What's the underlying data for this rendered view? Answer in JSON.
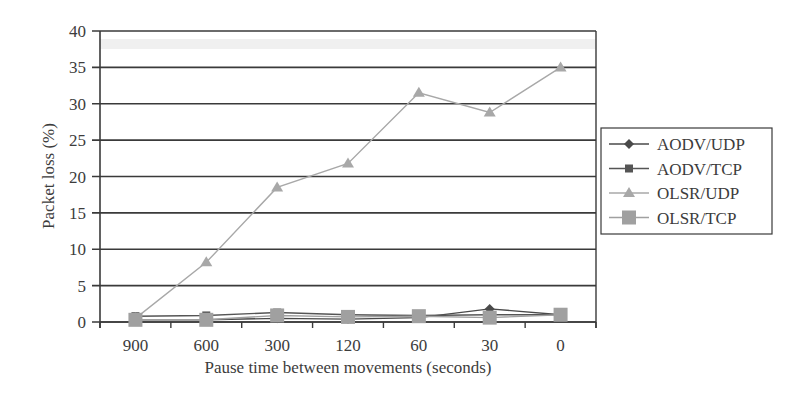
{
  "chart_data": {
    "type": "line",
    "title": "",
    "xlabel": "Pause time between movements (seconds)",
    "ylabel": "Packet loss (%)",
    "categories": [
      "900",
      "600",
      "300",
      "120",
      "60",
      "30",
      "0"
    ],
    "ylim": [
      0,
      40
    ],
    "yticks": [
      0,
      5,
      10,
      15,
      20,
      25,
      30,
      35,
      40
    ],
    "grid": true,
    "legend_position": "right",
    "series": [
      {
        "name": "AODV/UDP",
        "marker": "diamond",
        "color": "#4a4a4a",
        "values": [
          0.3,
          0.3,
          0.5,
          0.4,
          0.6,
          1.8,
          1.0
        ]
      },
      {
        "name": "AODV/TCP",
        "marker": "square-small",
        "color": "#555555",
        "values": [
          0.8,
          0.9,
          1.3,
          1.0,
          0.9,
          1.0,
          1.0
        ]
      },
      {
        "name": "OLSR/UDP",
        "marker": "triangle",
        "color": "#a8a8a8",
        "values": [
          0.5,
          8.2,
          18.5,
          21.8,
          31.5,
          28.8,
          35.0
        ]
      },
      {
        "name": "OLSR/TCP",
        "marker": "square-large",
        "color": "#a0a0a0",
        "values": [
          0.3,
          0.3,
          0.9,
          0.7,
          0.8,
          0.6,
          1.0
        ]
      }
    ]
  }
}
